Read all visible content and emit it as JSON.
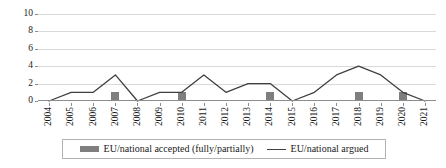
{
  "chart_data": {
    "type": "line",
    "title": "",
    "xlabel": "",
    "ylabel": "",
    "ylim": [
      0,
      10
    ],
    "yticks": [
      0,
      2,
      4,
      6,
      8,
      10
    ],
    "grid": true,
    "legend_position": "bottom",
    "categories": [
      "2004",
      "2005",
      "2006",
      "2007",
      "2008",
      "2009",
      "2010",
      "2011",
      "2012",
      "2013",
      "2014",
      "2015",
      "2016",
      "2017",
      "2018",
      "2019",
      "2020",
      "2021"
    ],
    "series": [
      {
        "name": "EU/national accepted (fully/partially)",
        "type": "bar",
        "color": "#7f7f7f",
        "values": [
          0,
          0,
          0,
          1,
          0,
          0,
          1,
          0,
          0,
          0,
          1,
          0,
          0,
          0,
          1,
          0,
          1,
          0
        ]
      },
      {
        "name": "EU/national argued",
        "type": "line",
        "color": "#404040",
        "values": [
          0,
          1,
          1,
          3,
          0,
          1,
          1,
          3,
          1,
          2,
          2,
          0,
          1,
          3,
          4,
          3,
          1,
          0
        ]
      }
    ]
  },
  "legend": {
    "entries": [
      {
        "label": "EU/national accepted (fully/partially)",
        "marker": "bar-swatch-icon"
      },
      {
        "label": "EU/national argued",
        "marker": "line-swatch-icon"
      }
    ]
  }
}
